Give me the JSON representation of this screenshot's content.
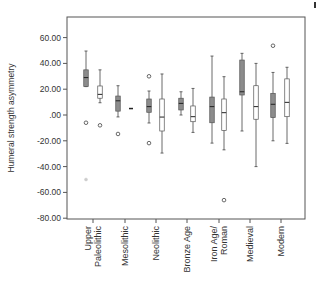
{
  "chart_data": {
    "type": "boxplot",
    "title": "",
    "xlabel": "",
    "ylabel": "Humeral strength asymmetry",
    "ylim": [
      -80,
      60
    ],
    "yticks": [
      {
        "value": 60,
        "label": "60.00"
      },
      {
        "value": 40,
        "label": "40.00"
      },
      {
        "value": 20,
        "label": "20.00"
      },
      {
        "value": 0,
        "label": ".00"
      },
      {
        "value": -20,
        "label": "-20.00"
      },
      {
        "value": -40,
        "label": "-40.00"
      },
      {
        "value": -60,
        "label": "-60.00"
      },
      {
        "value": -80,
        "label": "-80.00"
      }
    ],
    "grid": false,
    "legend": null,
    "categories": [
      {
        "lines": [
          "Upper",
          "Paleolithic"
        ]
      },
      {
        "lines": [
          "Mesolithic"
        ]
      },
      {
        "lines": [
          "Neolithic"
        ]
      },
      {
        "lines": [
          "Bronze Age"
        ]
      },
      {
        "lines": [
          "Iron Age/",
          "Roman"
        ]
      },
      {
        "lines": [
          "Medieval"
        ]
      },
      {
        "lines": [
          "Modern"
        ]
      }
    ],
    "series": [
      {
        "name": "filled",
        "fill": "#8c8c8c",
        "boxes": [
          {
            "cat": 0,
            "whisker_low": 22,
            "q1": 22,
            "median": 29,
            "q3": 35,
            "whisker_high": 49.6,
            "outliers": [
              -6
            ],
            "faint_outliers": [
              -50
            ]
          },
          {
            "cat": 1,
            "whisker_low": -1.5,
            "q1": 3,
            "median": 11,
            "q3": 14.7,
            "whisker_high": 22.7,
            "outliers": [
              -14.7
            ]
          },
          {
            "cat": 2,
            "whisker_low": -6.2,
            "q1": 2.1,
            "median": 6.5,
            "q3": 12.4,
            "whisker_high": 18.6,
            "outliers": [
              30,
              -21.8
            ]
          },
          {
            "cat": 3,
            "whisker_low": 0,
            "q1": 3.9,
            "median": 9,
            "q3": 13,
            "whisker_high": 18,
            "outliers": []
          },
          {
            "cat": 4,
            "whisker_low": -21.8,
            "q1": -6,
            "median": 6.5,
            "q3": 13.9,
            "whisker_high": 45.7,
            "outliers": []
          },
          {
            "cat": 5,
            "whisker_low": -12.4,
            "q1": 15.5,
            "median": 18,
            "q3": 42.6,
            "whisker_high": 47.8,
            "outliers": []
          },
          {
            "cat": 6,
            "whisker_low": -20,
            "q1": -2,
            "median": 8.3,
            "q3": 16.8,
            "whisker_high": 33,
            "outliers": [
              53.7
            ]
          }
        ]
      },
      {
        "name": "open",
        "fill": "#ffffff",
        "boxes": [
          {
            "cat": 0,
            "whisker_low": 9.5,
            "q1": 13,
            "median": 16,
            "q3": 22.5,
            "whisker_high": 35,
            "outliers": [
              -8
            ]
          },
          {
            "cat": 1,
            "single_value": 5
          },
          {
            "cat": 2,
            "whisker_low": -29.5,
            "q1": -12.4,
            "median": -1.6,
            "q3": 12.4,
            "whisker_high": 31.8,
            "outliers": []
          },
          {
            "cat": 3,
            "whisker_low": -13.5,
            "q1": -5.2,
            "median": -1.3,
            "q3": 7,
            "whisker_high": 20.6,
            "outliers": []
          },
          {
            "cat": 4,
            "whisker_low": -27,
            "q1": -12,
            "median": 1.8,
            "q3": 12.4,
            "whisker_high": 29.7,
            "outliers": [
              -66
            ]
          },
          {
            "cat": 5,
            "whisker_low": -40,
            "q1": -3.3,
            "median": 6.5,
            "q3": 22.7,
            "whisker_high": 40,
            "outliers": []
          },
          {
            "cat": 6,
            "whisker_low": -22,
            "q1": -1.3,
            "median": 9.8,
            "q3": 28,
            "whisker_high": 37,
            "outliers": []
          }
        ]
      }
    ]
  }
}
